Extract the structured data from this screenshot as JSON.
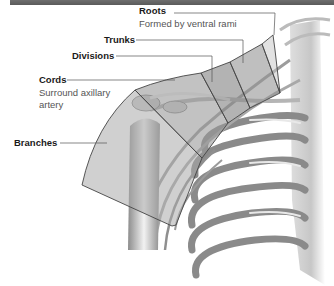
{
  "figure": {
    "title_bar_color": "#626262",
    "outline_color": "#444444",
    "region_fill_color": "#9a9a9a",
    "labels": [
      {
        "id": "roots",
        "title": "Roots",
        "description": "Formed by ventral rami"
      },
      {
        "id": "trunks",
        "title": "Trunks",
        "description": ""
      },
      {
        "id": "divisions",
        "title": "Divisions",
        "description": ""
      },
      {
        "id": "cords",
        "title": "Cords",
        "description_line1": "Surround axillary",
        "description_line2": "artery"
      },
      {
        "id": "branches",
        "title": "Branches",
        "description": ""
      }
    ]
  }
}
